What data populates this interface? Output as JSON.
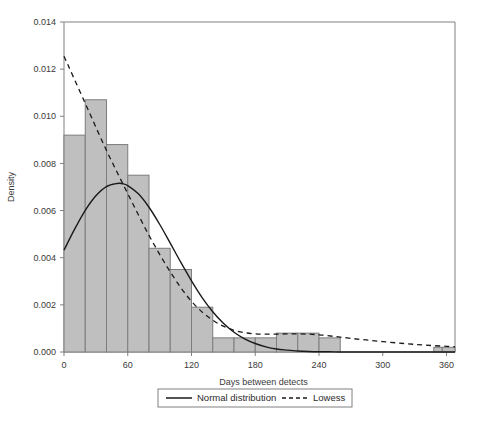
{
  "chart_data": {
    "type": "bar",
    "title": "",
    "subtitle": "",
    "xlabel": "Days between detects",
    "ylabel": "Density",
    "xlim": [
      0,
      368
    ],
    "ylim": [
      0.0,
      0.014
    ],
    "grid": false,
    "bin_width": 20,
    "categories": [
      "0-20",
      "20-40",
      "40-60",
      "60-80",
      "80-100",
      "100-120",
      "120-140",
      "140-160",
      "160-180",
      "180-200",
      "200-220",
      "220-240",
      "240-260",
      "340-360",
      "360-368"
    ],
    "bin_starts": [
      0,
      20,
      40,
      60,
      80,
      100,
      120,
      140,
      160,
      180,
      200,
      220,
      240,
      348,
      356
    ],
    "bin_ends": [
      20,
      40,
      60,
      80,
      100,
      120,
      140,
      160,
      180,
      200,
      220,
      240,
      260,
      356,
      368
    ],
    "values": [
      0.0092,
      0.0107,
      0.0088,
      0.0075,
      0.0044,
      0.0035,
      0.0019,
      0.0006,
      0.0006,
      0.0006,
      0.0008,
      0.0008,
      0.0006,
      0.0002,
      0.0002
    ],
    "xticks": [
      0,
      60,
      120,
      180,
      240,
      300,
      360
    ],
    "xtick_labels": [
      "0",
      "60",
      "120",
      "180",
      "240",
      "300",
      "360"
    ],
    "yticks": [
      0.0,
      0.002,
      0.004,
      0.006,
      0.008,
      0.01,
      0.012,
      0.014
    ],
    "ytick_labels": [
      "0.000",
      "0.002",
      "0.004",
      "0.006",
      "0.008",
      "0.010",
      "0.012",
      "0.014"
    ],
    "series": [
      {
        "name": "Normal distribution",
        "style": "solid",
        "color": "#1a1a1a",
        "x": [
          0,
          10,
          20,
          30,
          40,
          50,
          55,
          60,
          70,
          80,
          90,
          100,
          110,
          120,
          130,
          140,
          150,
          160,
          170,
          180,
          190,
          200,
          210,
          220,
          230,
          240,
          250,
          260,
          280,
          300,
          320,
          340,
          360,
          368
        ],
        "y": [
          0.00432,
          0.00521,
          0.00601,
          0.00663,
          0.00702,
          0.00715,
          0.00714,
          0.00706,
          0.00671,
          0.00614,
          0.00542,
          0.00462,
          0.0038,
          0.00302,
          0.00231,
          0.00171,
          0.00122,
          0.00084,
          0.00056,
          0.00036,
          0.00022,
          0.00013,
          8e-05,
          4e-05,
          2e-05,
          1e-05,
          1e-05,
          0.0,
          0.0,
          0.0,
          0.0,
          0.0,
          0.0,
          0.0
        ]
      },
      {
        "name": "Lowess",
        "style": "dashed",
        "color": "#1a1a1a",
        "x": [
          0,
          20,
          40,
          60,
          80,
          100,
          120,
          140,
          160,
          180,
          200,
          220,
          240,
          260,
          280,
          300,
          320,
          340,
          360,
          368
        ],
        "y": [
          0.01255,
          0.01055,
          0.00855,
          0.00672,
          0.00495,
          0.0034,
          0.00215,
          0.00135,
          0.00092,
          0.00077,
          0.00076,
          0.00077,
          0.00073,
          0.00063,
          0.00053,
          0.00044,
          0.00036,
          0.00029,
          0.00024,
          0.00022
        ]
      }
    ],
    "legend": {
      "position": "below-axes",
      "entries": [
        {
          "label": "Normal distribution",
          "style": "solid"
        },
        {
          "label": "Lowess",
          "style": "dashed"
        }
      ]
    }
  }
}
